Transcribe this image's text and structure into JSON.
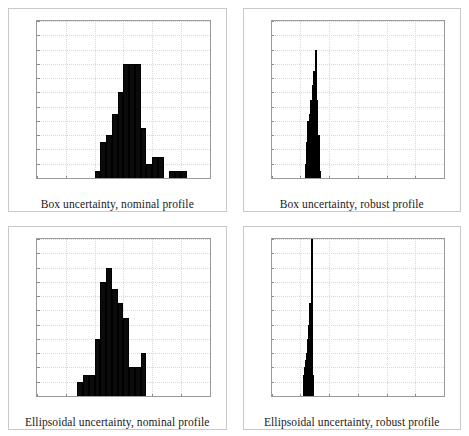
{
  "figure": {
    "layout": "2x2-grid",
    "panel_count": 4,
    "bar_color": "#0b0b0b",
    "grid_color": "#d8d8d8",
    "axis_color": "#9a9a9a",
    "frame_color": "#c9c9c9"
  },
  "axis": {
    "xticks": [
      10,
      15,
      20,
      25,
      30,
      35,
      40
    ],
    "yticks": [
      0,
      2,
      4,
      6,
      8,
      10,
      12,
      14,
      16,
      18,
      20,
      22
    ],
    "xlim": [
      10,
      40
    ],
    "ylim": [
      0,
      22
    ]
  },
  "chart_data": [
    {
      "type": "bar",
      "title": "Box uncertainty, nominal profile",
      "xlabel": "",
      "ylabel": "",
      "xlim": [
        10,
        40
      ],
      "ylim": [
        0,
        22
      ],
      "grid": true,
      "legend": "none",
      "bin_width": 1,
      "bin_starts": [
        20,
        21,
        22,
        23,
        24,
        25,
        26,
        27,
        28,
        29,
        30,
        31,
        33,
        34,
        35
      ],
      "values": [
        1,
        5,
        6,
        9,
        12,
        16,
        16,
        16,
        7,
        2,
        3,
        3,
        1,
        1,
        1
      ]
    },
    {
      "type": "bar",
      "title": "Box uncertainty, robust profile",
      "xlabel": "",
      "ylabel": "",
      "xlim": [
        10,
        40
      ],
      "ylim": [
        0,
        22
      ],
      "grid": true,
      "legend": "none",
      "bin_width": 0.25,
      "bin_starts": [
        15.75,
        16.0,
        16.25,
        16.5,
        16.75,
        17.0,
        17.25,
        17.5,
        17.75,
        18.0,
        18.25
      ],
      "values": [
        2,
        5,
        8,
        9,
        11,
        13,
        15,
        18,
        11,
        6,
        1
      ]
    },
    {
      "type": "bar",
      "title": "Ellipsoidal uncertainty, nominal profile",
      "xlabel": "",
      "ylabel": "",
      "xlim": [
        10,
        40
      ],
      "ylim": [
        0,
        22
      ],
      "grid": true,
      "legend": "none",
      "bin_width": 1,
      "bin_starts": [
        17,
        18,
        19,
        20,
        21,
        22,
        23,
        24,
        25,
        26,
        27,
        28
      ],
      "values": [
        2,
        3,
        3,
        8,
        16,
        18,
        15,
        13,
        11,
        4,
        4,
        6
      ]
    },
    {
      "type": "bar",
      "title": "Ellipsoidal uncertainty, robust profile",
      "xlabel": "",
      "ylabel": "",
      "xlim": [
        10,
        40
      ],
      "ylim": [
        0,
        22
      ],
      "grid": true,
      "legend": "none",
      "bin_width": 0.2,
      "bin_starts": [
        15.4,
        15.6,
        15.8,
        16.0,
        16.2,
        16.4,
        16.6,
        16.8,
        17.0
      ],
      "values": [
        3,
        4,
        5,
        6,
        8,
        10,
        13,
        22,
        3
      ]
    }
  ],
  "captions": [
    "Box uncertainty, nominal profile",
    "Box uncertainty, robust profile",
    "Ellipsoidal uncertainty, nominal profile",
    "Ellipsoidal uncertainty, robust profile"
  ]
}
